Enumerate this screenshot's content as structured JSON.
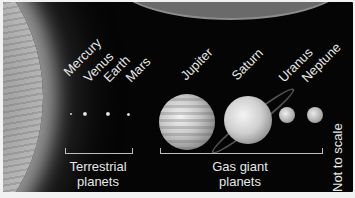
{
  "diagram": {
    "planets": [
      {
        "name": "Mercury",
        "group": "terrestrial"
      },
      {
        "name": "Venus",
        "group": "terrestrial"
      },
      {
        "name": "Earth",
        "group": "terrestrial"
      },
      {
        "name": "Mars",
        "group": "terrestrial"
      },
      {
        "name": "Jupiter",
        "group": "gas_giant"
      },
      {
        "name": "Saturn",
        "group": "gas_giant"
      },
      {
        "name": "Uranus",
        "group": "gas_giant"
      },
      {
        "name": "Neptune",
        "group": "gas_giant"
      }
    ],
    "groups": {
      "terrestrial": {
        "line1": "Terrestrial",
        "line2": "planets"
      },
      "gas_giant": {
        "line1": "Gas giant",
        "line2": "planets"
      }
    },
    "note": "Not to scale"
  }
}
